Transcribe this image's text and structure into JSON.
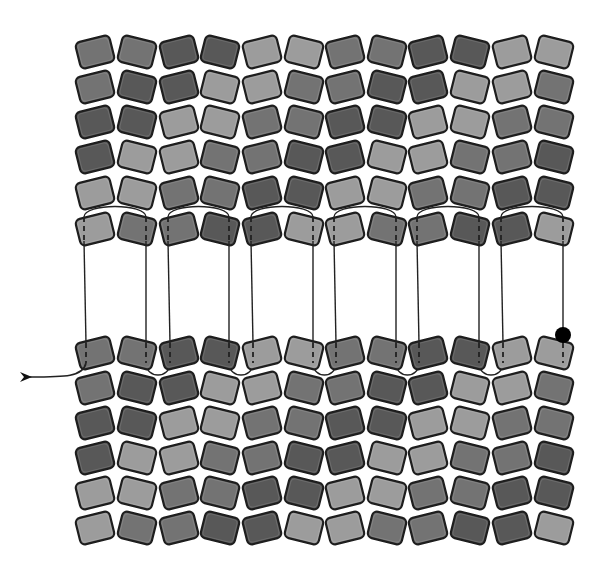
{
  "diagram": {
    "title": "",
    "type": "bead-weaving-stitch-diagram",
    "canvas": {
      "width": 603,
      "height": 569,
      "background": "#ffffff"
    },
    "palette": {
      "L": "#9c9c9c",
      "M": "#737373",
      "D": "#585858"
    },
    "bead": {
      "width": 35,
      "height": 27,
      "corner_radius": 5,
      "tilt_deg": 14,
      "stroke": "#1e1e1e"
    },
    "columns_x": [
      95,
      137,
      179,
      220,
      262,
      304,
      345,
      387,
      428,
      470,
      512,
      554
    ],
    "top_panel": {
      "rows_y": [
        52,
        87,
        122,
        157,
        193,
        229
      ],
      "rows": [
        "MMDDLLMMDDLL",
        "MDDLLMMDDLLM",
        "DDLLMMDDLLMM",
        "DLLMMDDLLMMD",
        "LLMMDDLLMMDD",
        "LMMDDLLMMDDL"
      ],
      "threaded_row_index": 5
    },
    "bottom_panel": {
      "rows_y": [
        353,
        388,
        423,
        458,
        493,
        528
      ],
      "rows": [
        "MMDDLLMMDDLL",
        "MDDLLMMDDLLM",
        "DDLLMMDDLLMM",
        "DLLMMDDLLMMD",
        "LLMMDDLLMMDD",
        "LMMDDLLMMDDL"
      ],
      "threaded_row_index": 0
    },
    "thread": {
      "color": "#222222",
      "width": 1.4,
      "start_marker": {
        "type": "dot",
        "x": 563,
        "y": 335,
        "r": 8,
        "color": "#000000"
      },
      "end_marker": {
        "type": "arrow",
        "x": 20,
        "y": 377,
        "direction": "left"
      },
      "description": "Ladder/zipper join: thread passes vertically through each bead of the top threaded row and bottom threaded row, with U-turn arcs over pairs in the top row and under pairs in the bottom row, exiting left with an arrow."
    }
  }
}
